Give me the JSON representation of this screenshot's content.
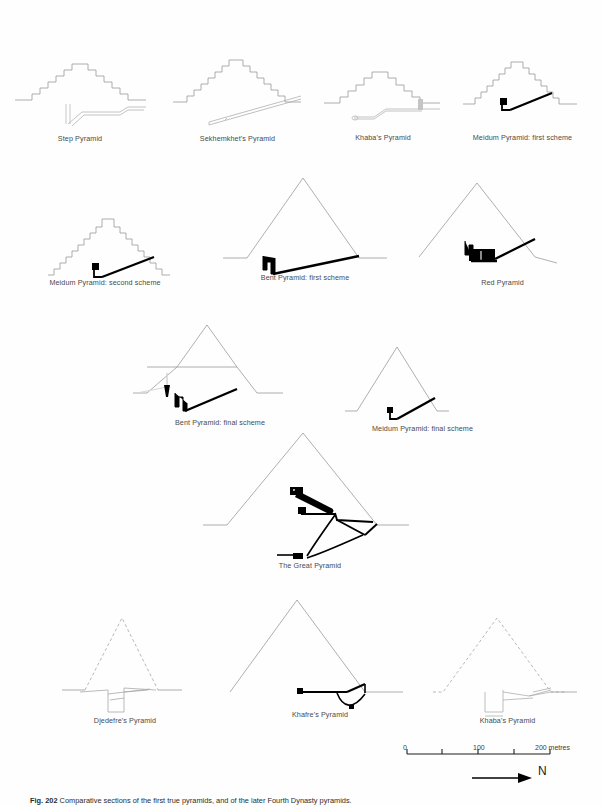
{
  "figure": {
    "caption_number": "Fig. 202",
    "caption_text": "Comparative sections of the first true pyramids, and of the later Fourth Dynasty pyramids."
  },
  "panels": [
    {
      "id": "step-pyramid",
      "label": "Step Pyramid",
      "row": 1,
      "col": 1
    },
    {
      "id": "sekhemkhets-pyramid",
      "label": "Sekhemkhet's Pyramid",
      "row": 1,
      "col": 2
    },
    {
      "id": "khabas-pyramid-top",
      "label": "Khaba's Pyramid",
      "row": 1,
      "col": 3
    },
    {
      "id": "meidum-first-scheme",
      "label": "Meidum Pyramid: first scheme",
      "row": 1,
      "col": 4
    },
    {
      "id": "meidum-second-scheme",
      "label": "Meidum Pyramid: second scheme",
      "row": 2,
      "col": 1
    },
    {
      "id": "bent-first-scheme",
      "label": "Bent Pyramid: first scheme",
      "row": 2,
      "col": 2
    },
    {
      "id": "red-pyramid",
      "label": "Red Pyramid",
      "row": 2,
      "col": 3
    },
    {
      "id": "bent-final-scheme",
      "label": "Bent Pyramid: final scheme",
      "row": 3,
      "col": 1
    },
    {
      "id": "meidum-final-scheme",
      "label": "Meidum Pyramid: final scheme",
      "row": 3,
      "col": 2
    },
    {
      "id": "great-pyramid",
      "label": "The Great Pyramid",
      "row": 4,
      "col": 1
    },
    {
      "id": "djedefres-pyramid",
      "label": "Djedefre's Pyramid",
      "row": 5,
      "col": 1
    },
    {
      "id": "khafres-pyramid",
      "label": "Khafre's Pyramid",
      "row": 5,
      "col": 2
    },
    {
      "id": "khabas-pyramid-bottom",
      "label": "Khaba's Pyramid",
      "row": 5,
      "col": 3
    }
  ],
  "scale": {
    "ticks": [
      "0",
      "100",
      "200 metres"
    ],
    "tick_values": [
      0,
      50,
      100,
      150,
      200
    ],
    "unit": "metres"
  },
  "compass": {
    "direction_label": "N",
    "arrow": "north-arrow"
  },
  "colors": {
    "outline": "#9a9a9a",
    "structure": "#000000",
    "ghost": "#c9c9c9",
    "label": "#4a4a4a"
  }
}
